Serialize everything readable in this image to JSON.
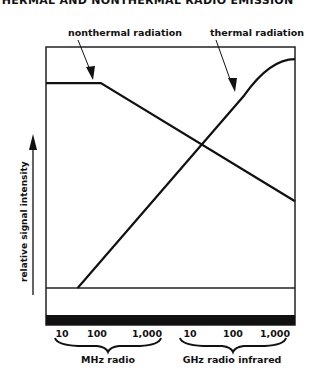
{
  "title": "THERMAL AND NONTHERMAL RADIO EMISSION",
  "chart_data": {
    "type": "line",
    "title": "THERMAL AND NONTHERMAL RADIO EMISSION",
    "ylabel": "relative signal intensity",
    "xlabel": "",
    "x_scale": "log (frequency)",
    "tick_labels": [
      "10",
      "100",
      "1,000",
      "10",
      "100",
      "1,000"
    ],
    "tick_positions": [
      1,
      2,
      3,
      4,
      5,
      6
    ],
    "band_labels": [
      {
        "label": "MHz radio",
        "from": 1,
        "to": 3
      },
      {
        "label": "GHz radio infrared",
        "from": 4,
        "to": 6
      }
    ],
    "xlim": [
      0.6,
      6.5
    ],
    "ylim": [
      0,
      1
    ],
    "grid": false,
    "series": [
      {
        "name": "nonthermal radiation",
        "points": [
          [
            0.6,
            0.85
          ],
          [
            1.9,
            0.85
          ],
          [
            6.5,
            0.36
          ]
        ]
      },
      {
        "name": "thermal radiation",
        "points": [
          [
            1.35,
            0.0
          ],
          [
            3.0,
            0.42
          ],
          [
            5.3,
            0.8
          ],
          [
            5.9,
            0.92
          ],
          [
            6.5,
            0.95
          ]
        ]
      }
    ],
    "annotations": [
      {
        "text": "nonthermal radiation",
        "points_to": "nonthermal radiation"
      },
      {
        "text": "thermal radiation",
        "points_to": "thermal radiation"
      }
    ]
  }
}
